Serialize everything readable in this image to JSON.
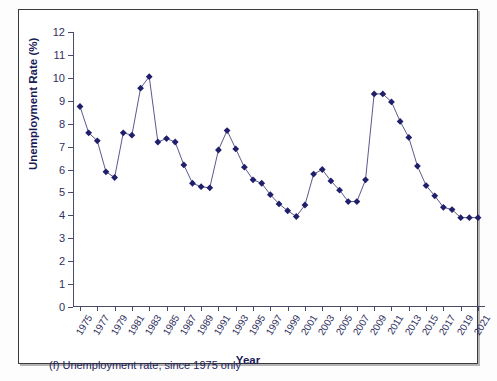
{
  "figure": {
    "caption": "(f) Unemployment rate, since 1975 only"
  },
  "chart_data": {
    "type": "line",
    "title": "",
    "xlabel": "Year",
    "ylabel": "Unemployment Rate (%)",
    "ylim": [
      0,
      12
    ],
    "ytick_labels": [
      "0",
      "1",
      "2",
      "3",
      "4",
      "5",
      "6",
      "7",
      "8",
      "9",
      "10",
      "11",
      "12"
    ],
    "ytick_values": [
      0,
      1,
      2,
      3,
      4,
      5,
      6,
      7,
      8,
      9,
      10,
      11,
      12
    ],
    "xlim": [
      1975,
      2021
    ],
    "xtick_labels": [
      "1975",
      "1977",
      "1979",
      "1981",
      "1983",
      "1985",
      "1987",
      "1989",
      "1991",
      "1993",
      "1995",
      "1997",
      "1999",
      "2001",
      "2003",
      "2005",
      "2007",
      "2009",
      "2011",
      "2013",
      "2015",
      "2017",
      "2019",
      "2021"
    ],
    "xtick_values": [
      1975,
      1977,
      1979,
      1981,
      1983,
      1985,
      1987,
      1989,
      1991,
      1993,
      1995,
      1997,
      1999,
      2001,
      2003,
      2005,
      2007,
      2009,
      2011,
      2013,
      2015,
      2017,
      2019,
      2021
    ],
    "grid": false,
    "legend": null,
    "marker": "diamond",
    "series_color": "#1f1f6b",
    "line_color": "#5a5a8c",
    "x": [
      1975,
      1976,
      1977,
      1978,
      1979,
      1980,
      1981,
      1982,
      1983,
      1984,
      1985,
      1986,
      1987,
      1988,
      1989,
      1990,
      1991,
      1992,
      1993,
      1994,
      1995,
      1996,
      1997,
      1998,
      1999,
      2000,
      2001,
      2002,
      2003,
      2004,
      2005,
      2006,
      2007,
      2008,
      2009,
      2010,
      2011,
      2012,
      2013,
      2014,
      2015,
      2016,
      2017,
      2018,
      2019,
      2020,
      2021
    ],
    "values": [
      8.75,
      7.6,
      7.25,
      5.9,
      5.65,
      7.6,
      7.5,
      9.55,
      10.05,
      7.2,
      7.35,
      7.2,
      6.2,
      5.4,
      5.25,
      5.2,
      6.85,
      7.7,
      6.9,
      6.1,
      5.55,
      5.4,
      4.9,
      4.5,
      4.2,
      3.95,
      4.45,
      5.8,
      6.0,
      5.5,
      5.1,
      4.6,
      4.6,
      5.55,
      9.3,
      9.3,
      8.95,
      8.1,
      7.4,
      6.15,
      5.3,
      4.85,
      4.35,
      4.25,
      3.9,
      3.9,
      3.9
    ]
  }
}
